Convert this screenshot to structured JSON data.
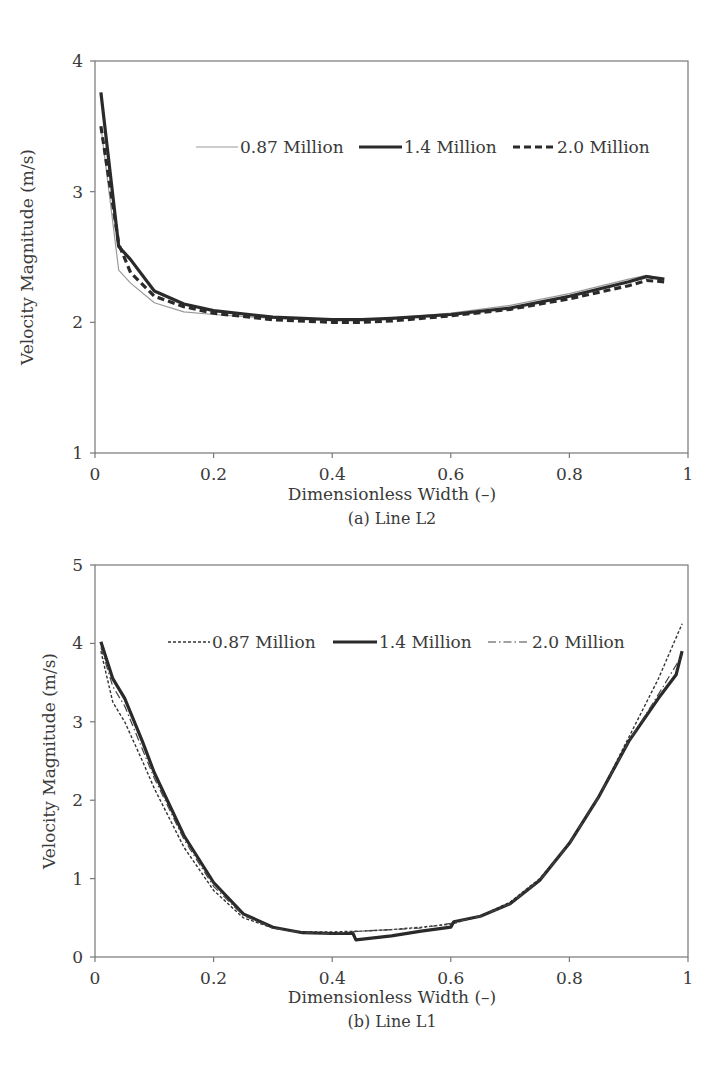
{
  "chart_data": [
    {
      "type": "line",
      "caption": "(a) Line L2",
      "title": "",
      "xlabel": "Dimensionless Width (–)",
      "ylabel": "Velocity Magnitude (m/s)",
      "xlim": [
        0,
        1
      ],
      "ylim": [
        1,
        4
      ],
      "xticks": [
        "0",
        "0.2",
        "0.4",
        "0.6",
        "0.8",
        "1"
      ],
      "yticks": [
        "1",
        "2",
        "3",
        "4"
      ],
      "grid": false,
      "legend_position": "upper-right inside",
      "series": [
        {
          "name": "0.87 Million",
          "style": "thin-solid",
          "x": [
            0.01,
            0.04,
            0.06,
            0.1,
            0.15,
            0.2,
            0.3,
            0.4,
            0.45,
            0.5,
            0.6,
            0.7,
            0.8,
            0.9,
            0.93,
            0.96
          ],
          "values": [
            3.5,
            2.4,
            2.3,
            2.15,
            2.08,
            2.06,
            2.03,
            2.02,
            2.02,
            2.03,
            2.07,
            2.13,
            2.22,
            2.33,
            2.36,
            2.33
          ]
        },
        {
          "name": "1.4 Million",
          "style": "thick-solid",
          "x": [
            0.01,
            0.04,
            0.06,
            0.1,
            0.15,
            0.2,
            0.3,
            0.4,
            0.45,
            0.5,
            0.6,
            0.7,
            0.8,
            0.9,
            0.93,
            0.96
          ],
          "values": [
            3.76,
            2.58,
            2.48,
            2.24,
            2.14,
            2.09,
            2.04,
            2.02,
            2.02,
            2.03,
            2.06,
            2.11,
            2.2,
            2.31,
            2.35,
            2.33
          ]
        },
        {
          "name": "2.0 Million",
          "style": "dashed",
          "x": [
            0.01,
            0.04,
            0.06,
            0.1,
            0.15,
            0.2,
            0.3,
            0.4,
            0.45,
            0.5,
            0.6,
            0.7,
            0.8,
            0.9,
            0.93,
            0.96
          ],
          "values": [
            3.5,
            2.6,
            2.38,
            2.2,
            2.12,
            2.07,
            2.02,
            2.0,
            2.0,
            2.01,
            2.05,
            2.1,
            2.18,
            2.28,
            2.32,
            2.31
          ]
        }
      ]
    },
    {
      "type": "line",
      "caption": "(b) Line L1",
      "title": "",
      "xlabel": "Dimensionless Width (–)",
      "ylabel": "Velocity  Magnitude (m/s)",
      "xlim": [
        0,
        1
      ],
      "ylim": [
        0,
        5
      ],
      "xticks": [
        "0",
        "0.2",
        "0.4",
        "0.6",
        "0.8",
        "1"
      ],
      "yticks": [
        "0",
        "1",
        "2",
        "3",
        "4",
        "5"
      ],
      "grid": false,
      "legend_position": "upper inside",
      "series": [
        {
          "name": "0.87 Million",
          "style": "dotted",
          "x": [
            0.01,
            0.03,
            0.05,
            0.08,
            0.1,
            0.15,
            0.2,
            0.25,
            0.3,
            0.35,
            0.4,
            0.45,
            0.5,
            0.55,
            0.6,
            0.65,
            0.7,
            0.75,
            0.8,
            0.85,
            0.9,
            0.95,
            0.99
          ],
          "values": [
            3.9,
            3.25,
            3.0,
            2.5,
            2.15,
            1.4,
            0.85,
            0.5,
            0.37,
            0.32,
            0.32,
            0.33,
            0.35,
            0.38,
            0.42,
            0.52,
            0.7,
            1.0,
            1.45,
            2.05,
            2.8,
            3.55,
            4.25
          ]
        },
        {
          "name": "1.4 Million",
          "style": "thick-solid",
          "x": [
            0.01,
            0.03,
            0.05,
            0.08,
            0.1,
            0.15,
            0.2,
            0.25,
            0.3,
            0.35,
            0.4,
            0.435,
            0.44,
            0.5,
            0.55,
            0.6,
            0.605,
            0.65,
            0.7,
            0.75,
            0.8,
            0.85,
            0.9,
            0.95,
            0.98,
            0.99
          ],
          "values": [
            4.02,
            3.55,
            3.3,
            2.75,
            2.35,
            1.55,
            0.95,
            0.55,
            0.38,
            0.31,
            0.3,
            0.3,
            0.22,
            0.27,
            0.33,
            0.38,
            0.45,
            0.52,
            0.68,
            0.98,
            1.45,
            2.05,
            2.75,
            3.3,
            3.6,
            3.9
          ]
        },
        {
          "name": "2.0 Million",
          "style": "dash-dot",
          "x": [
            0.01,
            0.03,
            0.05,
            0.08,
            0.1,
            0.15,
            0.2,
            0.25,
            0.3,
            0.35,
            0.4,
            0.45,
            0.5,
            0.55,
            0.6,
            0.65,
            0.7,
            0.75,
            0.8,
            0.85,
            0.9,
            0.95,
            0.99
          ],
          "values": [
            3.95,
            3.45,
            3.2,
            2.65,
            2.28,
            1.5,
            0.9,
            0.53,
            0.37,
            0.31,
            0.3,
            0.33,
            0.35,
            0.37,
            0.43,
            0.52,
            0.68,
            0.98,
            1.45,
            2.05,
            2.75,
            3.35,
            3.85
          ]
        }
      ]
    }
  ]
}
